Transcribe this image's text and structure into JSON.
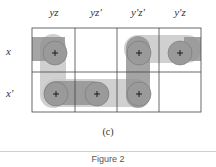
{
  "diagram": {
    "type": "karnaugh-map",
    "columns": [
      "yz",
      "yz'",
      "y'z'",
      "y'z"
    ],
    "rows": [
      "x",
      "x'"
    ],
    "cells": [
      [
        "+",
        "",
        "+",
        "+"
      ],
      [
        "+",
        "+",
        "+",
        ""
      ]
    ],
    "groupings": [
      {
        "cells": [
          [
            0,
            0
          ],
          [
            1,
            0
          ]
        ],
        "description": "x row wraps with yz column"
      },
      {
        "cells": [
          [
            1,
            0
          ],
          [
            1,
            1
          ],
          [
            1,
            2
          ]
        ],
        "description": "x' row group"
      },
      {
        "cells": [
          [
            0,
            2
          ],
          [
            1,
            2
          ]
        ],
        "description": "y'z' column group"
      },
      {
        "cells": [
          [
            0,
            2
          ],
          [
            0,
            3
          ]
        ],
        "description": "x row right group"
      }
    ],
    "colors": {
      "dark_loop": "#8f8f8f",
      "light_loop": "#c8c8c8",
      "grid": "#444444"
    }
  },
  "caption": "(c)",
  "figure_label": "Figure 2"
}
